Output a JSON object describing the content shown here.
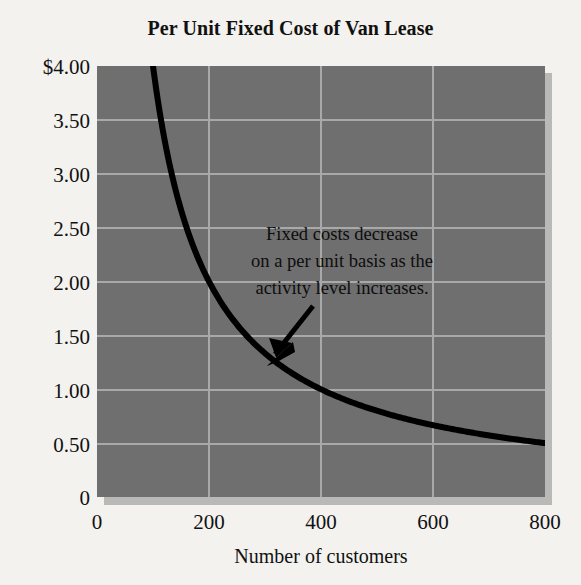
{
  "chart_data": {
    "type": "line",
    "title": "Per Unit Fixed Cost of Van Lease",
    "xlabel": "Number of customers",
    "ylabel": "",
    "xlim": [
      0,
      800
    ],
    "ylim": [
      0,
      4.0
    ],
    "xticks": [
      "0",
      "200",
      "400",
      "600",
      "800"
    ],
    "xtick_values": [
      0,
      200,
      400,
      600,
      800
    ],
    "yticks": [
      "0",
      "0.50",
      "1.00",
      "1.50",
      "2.00",
      "2.50",
      "3.00",
      "3.50",
      "$4.00"
    ],
    "ytick_values": [
      0,
      0.5,
      1.0,
      1.5,
      2.0,
      2.5,
      3.0,
      3.5,
      4.0
    ],
    "grid": true,
    "legend": "none",
    "series": [
      {
        "name": "Per unit fixed cost",
        "formula": "total fixed cost 400 divided by number of customers",
        "x": [
          100,
          125,
          150,
          175,
          200,
          250,
          300,
          350,
          400,
          450,
          500,
          550,
          600,
          650,
          700,
          750,
          800
        ],
        "values": [
          4.0,
          3.2,
          2.67,
          2.29,
          2.0,
          1.6,
          1.33,
          1.14,
          1.0,
          0.89,
          0.8,
          0.73,
          0.67,
          0.62,
          0.57,
          0.53,
          0.5
        ]
      }
    ],
    "annotations": [
      {
        "text_lines": [
          "Fixed costs decrease",
          "on a per unit basis as the",
          "activity level increases."
        ],
        "arrow": "points down-left toward the curve near 350 customers"
      }
    ]
  },
  "chart": {
    "title": "Per Unit Fixed Cost of Van Lease",
    "x_axis_title": "Number of customers",
    "annotation_line_1": "Fixed costs decrease",
    "annotation_line_2": "on a per unit basis as the",
    "annotation_line_3": "activity level increases.",
    "y_ticks": [
      "$4.00",
      "3.50",
      "3.00",
      "2.50",
      "2.00",
      "1.50",
      "1.00",
      "0.50",
      "0"
    ],
    "x_ticks": [
      "0",
      "200",
      "400",
      "600",
      "800"
    ]
  },
  "colors": {
    "page_background": "#f3f2ef",
    "plot_background": "#6f6f6f",
    "gridline": "#a9a9a9",
    "curve": "#000000",
    "shadow": "#b9b9b7",
    "text": "#111111"
  }
}
